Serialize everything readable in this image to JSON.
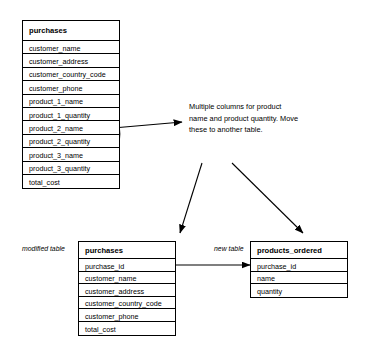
{
  "diagram": {
    "stroke_color": "#000000",
    "background_color": "#ffffff"
  },
  "original_table": {
    "name": "purchases",
    "columns": [
      "customer_name",
      "customer_address",
      "customer_country_code",
      "customer_phone",
      "product_1_name",
      "product_1_quantity",
      "product_2_name",
      "product_2_quantity",
      "product_3_name",
      "product_3_quantity",
      "total_cost"
    ]
  },
  "annotation": {
    "text": "Multiple columns for product name and product quantity. Move these to another table."
  },
  "modified_table": {
    "caption": "modified table",
    "name": "purchases",
    "columns": [
      "purchase_id",
      "customer_name",
      "customer_address",
      "customer_country_code",
      "customer_phone",
      "total_cost"
    ]
  },
  "new_table": {
    "caption": "new table",
    "name": "products_ordered",
    "columns": [
      "purchase_id",
      "name",
      "quantity"
    ]
  },
  "connectors": [
    {
      "name": "ellipse-to-annotation-arrow",
      "type": "arrow",
      "from": "highlight-ellipse",
      "to": "annotation"
    },
    {
      "name": "annotation-to-modified-table-arrow",
      "type": "arrow",
      "from": "annotation",
      "to": "modified_table"
    },
    {
      "name": "annotation-to-new-table-arrow",
      "type": "arrow",
      "from": "annotation",
      "to": "new_table"
    },
    {
      "name": "purchase-id-relationship",
      "type": "double-arrow",
      "from": "modified_table.purchase_id",
      "to": "new_table.purchase_id"
    }
  ],
  "highlight": {
    "name": "product-columns-ellipse",
    "shape": "ellipse",
    "targets": [
      "product_1_name",
      "product_1_quantity",
      "product_2_name",
      "product_2_quantity",
      "product_3_name",
      "product_3_quantity"
    ]
  }
}
